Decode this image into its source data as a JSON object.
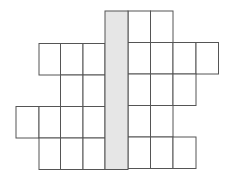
{
  "diagram": {
    "type": "grid-net",
    "line_color": "#555555",
    "cell_fill": "#ffffff",
    "shaded_fill": "#e6e6e6",
    "col_edges_left": [
      16,
      39,
      60.5,
      83,
      105
    ],
    "col_edges_right": [
      105,
      128,
      150.5,
      173,
      196,
      218.5
    ],
    "row_edges_left": [
      11,
      43.5,
      75,
      106.5,
      138,
      169.5
    ],
    "row_edges_right": [
      11,
      42.5,
      74,
      105.5,
      137,
      168.5
    ],
    "shaded_column": {
      "x": 105,
      "y": 11,
      "w": 23,
      "h": 158.5
    },
    "rows": [
      {
        "left_cols": [],
        "right_cols": [
          0,
          1
        ]
      },
      {
        "left_cols": [
          1,
          2,
          3
        ],
        "right_cols": [
          0,
          1,
          2,
          3
        ]
      },
      {
        "left_cols": [
          2,
          3
        ],
        "right_cols": [
          0,
          1,
          2
        ]
      },
      {
        "left_cols": [
          0,
          1,
          2,
          3
        ],
        "right_cols": [
          0,
          1
        ]
      },
      {
        "left_cols": [
          1,
          2,
          3
        ],
        "right_cols": [
          0,
          1,
          2
        ]
      }
    ]
  }
}
